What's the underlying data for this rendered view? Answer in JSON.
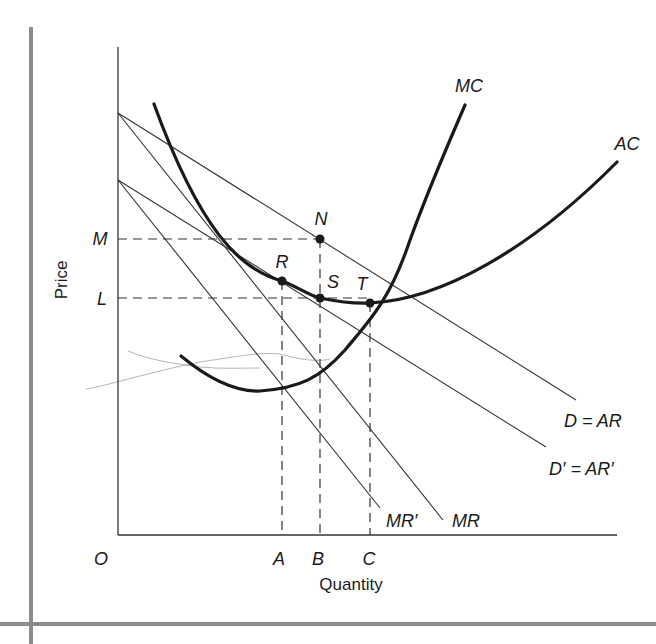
{
  "figure": {
    "type": "monopolistic-competition-cost-revenue-diagram",
    "axes": {
      "y_label": "Price",
      "x_label": "Quantity",
      "origin_label": "O"
    },
    "price_levels": [
      {
        "label": "M"
      },
      {
        "label": "L"
      }
    ],
    "quantity_levels": [
      {
        "label": "A"
      },
      {
        "label": "B"
      },
      {
        "label": "C"
      }
    ],
    "points": [
      {
        "label": "N"
      },
      {
        "label": "R"
      },
      {
        "label": "S"
      },
      {
        "label": "T"
      }
    ],
    "curves": {
      "mc": "MC",
      "ac": "AC",
      "d_ar": "D = AR",
      "d_ar_prime": "D′ = AR′",
      "mr": "MR",
      "mr_prime": "MR′"
    },
    "colors": {
      "ink": "#1a1a1a",
      "thin_line": "#333333",
      "frame": "#8c8c8c",
      "stray_mark": "#b5b5b5"
    }
  }
}
